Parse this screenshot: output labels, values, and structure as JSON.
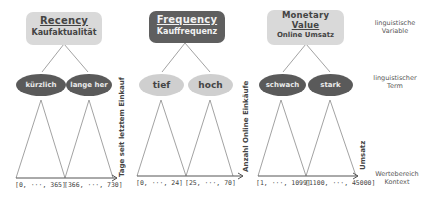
{
  "variables": [
    {
      "title": "Recency",
      "subtitle": "Kaufaktualität",
      "style": "light",
      "terms": [
        "kürzlich",
        "lange her"
      ],
      "term_style": "dark",
      "axis_label": "Tage seit letztem Einkauf",
      "ranges": [
        "[0, ···, 365]",
        "[366, ···, 730]"
      ]
    },
    {
      "title": "Frequency",
      "subtitle": "Kauffrequenz",
      "style": "dark",
      "terms": [
        "tief",
        "hoch"
      ],
      "term_style": "light",
      "axis_label": "Anzahl Online Einkäufe",
      "ranges": [
        "[0, ···, 24]",
        "[25, ···, 70]"
      ]
    },
    {
      "title": "Monetary Value",
      "title_line1": "Monetary",
      "title_line2": "Value",
      "subtitle": "Online Umsatz",
      "style": "light",
      "terms": [
        "schwach",
        "stark"
      ],
      "term_style": "dark",
      "axis_label": "Umsatz",
      "ranges": [
        "[1, ···, 1099]",
        "[1100, ···, 45000]"
      ]
    }
  ],
  "legend": {
    "variable": "linguistische Variable",
    "term": "linguistischer Term",
    "context": "Wertebereich Kontext"
  },
  "colors": {
    "light_fill": "#d9d9d9",
    "dark_fill": "#5f5f5f",
    "line": "#777777"
  }
}
